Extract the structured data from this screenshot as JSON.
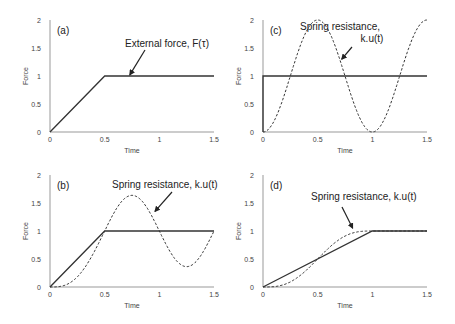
{
  "chart_data": [
    {
      "id": "a",
      "type": "line",
      "panel_label": "(a)",
      "xlabel": "Time",
      "ylabel": "Force",
      "xlim": [
        0,
        1.5
      ],
      "ylim": [
        0,
        2
      ],
      "xticks": [
        "0",
        "0.5",
        "1",
        "1.5"
      ],
      "yticks": [
        "0",
        "0.5",
        "1",
        "1.5",
        "2"
      ],
      "series": [
        {
          "name": "External force, F(τ)",
          "style": "solid",
          "x": [
            0,
            0.5,
            1.5
          ],
          "y": [
            0,
            1,
            1
          ]
        }
      ],
      "annotations": [
        {
          "text": [
            "External force, F(τ)"
          ],
          "arrow_to": [
            0.73,
            1.02
          ]
        }
      ]
    },
    {
      "id": "c",
      "type": "line",
      "panel_label": "(c)",
      "xlabel": "Time",
      "ylabel": "Force",
      "xlim": [
        0,
        1.5
      ],
      "ylim": [
        0,
        2
      ],
      "xticks": [
        "0",
        "0.5",
        "1",
        "1.5"
      ],
      "yticks": [
        "0",
        "0.5",
        "1",
        "1.5",
        "2"
      ],
      "series": [
        {
          "name": "External force (step)",
          "style": "solid",
          "x": [
            0,
            0,
            1.5
          ],
          "y": [
            0,
            1,
            1
          ]
        },
        {
          "name": "Spring resistance, k.u(t)",
          "style": "dashed",
          "rise_time": 0,
          "period": 1,
          "x": [
            0,
            0.25,
            0.5,
            0.75,
            1,
            1.25,
            1.5
          ],
          "y": [
            0,
            1,
            2,
            1,
            0,
            1,
            2
          ]
        }
      ],
      "annotations": [
        {
          "text": [
            "Spring resistance,",
            "k.u(t)"
          ],
          "arrow_to": [
            0.72,
            1.3
          ]
        }
      ]
    },
    {
      "id": "b",
      "type": "line",
      "panel_label": "(b)",
      "xlabel": "Time",
      "ylabel": "Force",
      "xlim": [
        0,
        1.5
      ],
      "ylim": [
        0,
        2
      ],
      "xticks": [
        "0",
        "0.5",
        "1",
        "1.5"
      ],
      "yticks": [
        "0",
        "0.5",
        "1",
        "1.5",
        "2"
      ],
      "series": [
        {
          "name": "External force (ramp, tr=0.5)",
          "style": "solid",
          "x": [
            0,
            0.5,
            1.5
          ],
          "y": [
            0,
            1,
            1
          ]
        },
        {
          "name": "Spring resistance, k.u(t)",
          "style": "dashed",
          "rise_time": 0.5,
          "period": 1,
          "x": [
            0,
            0.25,
            0.5,
            0.75,
            1,
            1.25,
            1.5
          ],
          "y": [
            0,
            0.18,
            1,
            1.64,
            1,
            0.36,
            1
          ]
        }
      ],
      "annotations": [
        {
          "text": [
            "Spring resistance, k.u(t)"
          ],
          "arrow_to": [
            0.96,
            1.35
          ]
        }
      ]
    },
    {
      "id": "d",
      "type": "line",
      "panel_label": "(d)",
      "xlabel": "Time",
      "ylabel": "Force",
      "xlim": [
        0,
        1.5
      ],
      "ylim": [
        0,
        2
      ],
      "xticks": [
        "0",
        "0.5",
        "1",
        "1.5"
      ],
      "yticks": [
        "0",
        "0.5",
        "1",
        "1.5",
        "2"
      ],
      "series": [
        {
          "name": "External force (ramp, tr=1)",
          "style": "solid",
          "x": [
            0,
            1,
            1.5
          ],
          "y": [
            0,
            1,
            1
          ]
        },
        {
          "name": "Spring resistance, k.u(t)",
          "style": "dashed",
          "rise_time": 1,
          "period": 1,
          "x": [
            0,
            0.25,
            0.5,
            0.75,
            1,
            1.5
          ],
          "y": [
            0.0,
            0.09,
            0.5,
            0.91,
            1,
            1
          ]
        }
      ],
      "annotations": [
        {
          "text": [
            "Spring resistance, k.u(t)"
          ],
          "arrow_to": [
            0.82,
            1.05
          ]
        }
      ]
    }
  ]
}
